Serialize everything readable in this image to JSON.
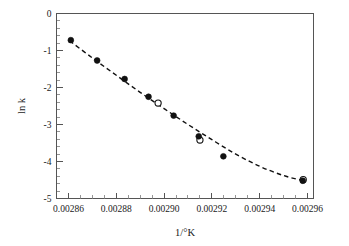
{
  "chart_data": {
    "type": "scatter",
    "title": "",
    "xlabel": "1/°K",
    "ylabel": "ln k",
    "xlim": [
      0.002855,
      0.0029625
    ],
    "ylim": [
      -5,
      0
    ],
    "grid": false,
    "legend_position": "none",
    "x_ticks": [
      0.00286,
      0.00288,
      0.0029,
      0.00292,
      0.00294,
      0.00296
    ],
    "x_tick_labels": [
      "0.00286",
      "0.00288",
      "0.00290",
      "0.00292",
      "0.00294",
      "0.00296"
    ],
    "x_minor_step": 5e-06,
    "y_ticks": [
      0,
      -1,
      -2,
      -3,
      -4,
      -5
    ],
    "y_tick_labels": [
      "0",
      "-1",
      "-2",
      "-3",
      "-4",
      "-5"
    ],
    "y_minor_step": 0.2,
    "series": [
      {
        "name": "filled",
        "marker": "filled-circle",
        "color": "#111111",
        "points": [
          {
            "x": 0.002861,
            "y": -0.72
          },
          {
            "x": 0.002872,
            "y": -1.27
          },
          {
            "x": 0.0028835,
            "y": -1.77
          },
          {
            "x": 0.0028935,
            "y": -2.25
          },
          {
            "x": 0.002904,
            "y": -2.76
          },
          {
            "x": 0.0029145,
            "y": -3.32
          },
          {
            "x": 0.0029248,
            "y": -3.86
          },
          {
            "x": 0.002958,
            "y": -4.52
          }
        ]
      },
      {
        "name": "open",
        "marker": "open-circle",
        "color": "#111111",
        "points": [
          {
            "x": 0.0028975,
            "y": -2.42
          },
          {
            "x": 0.002915,
            "y": -3.42
          },
          {
            "x": 0.0029582,
            "y": -4.49
          }
        ]
      }
    ],
    "fit_curve": {
      "name": "fitted-trend",
      "style": "dashed",
      "color": "#111111",
      "points": [
        {
          "x": 0.0028605,
          "y": -0.74
        },
        {
          "x": 0.00287,
          "y": -1.2
        },
        {
          "x": 0.00288,
          "y": -1.67
        },
        {
          "x": 0.00289,
          "y": -2.13
        },
        {
          "x": 0.0029,
          "y": -2.57
        },
        {
          "x": 0.00291,
          "y": -3.0
        },
        {
          "x": 0.00292,
          "y": -3.41
        },
        {
          "x": 0.00293,
          "y": -3.8
        },
        {
          "x": 0.00294,
          "y": -4.13
        },
        {
          "x": 0.00295,
          "y": -4.38
        },
        {
          "x": 0.002959,
          "y": -4.53
        }
      ]
    }
  },
  "labels": {
    "x_axis_title": "1/°K",
    "y_axis_title": "ln k"
  }
}
